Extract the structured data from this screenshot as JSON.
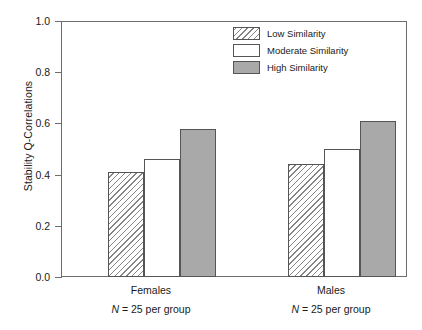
{
  "chart_data": {
    "type": "bar",
    "title": "",
    "subtitle": "",
    "xlabel": "",
    "ylabel": "Stability Q-Correlations",
    "ylim": [
      0.0,
      1.0
    ],
    "ytick_labels": [
      "0.0",
      "0.2",
      "0.4",
      "0.6",
      "0.8",
      "1.0"
    ],
    "ytick_values": [
      0.0,
      0.2,
      0.4,
      0.6,
      0.8,
      1.0
    ],
    "grid": false,
    "legend_position": "top-right",
    "categories": [
      "Females",
      "Males"
    ],
    "category_annotations": [
      "N = 25 per group",
      "N = 25 per group"
    ],
    "series": [
      {
        "name": "Low Similarity",
        "values": [
          0.41,
          0.44
        ],
        "fill": "diagonal-hatch",
        "color": "#ffffff"
      },
      {
        "name": "Moderate Similarity",
        "values": [
          0.46,
          0.5
        ],
        "fill": "solid",
        "color": "#ffffff"
      },
      {
        "name": "High Similarity",
        "values": [
          0.58,
          0.61
        ],
        "fill": "solid",
        "color": "#a9a9a9"
      }
    ]
  },
  "legend": {
    "items": [
      {
        "label": "Low Similarity",
        "swatch": "low"
      },
      {
        "label": "Moderate Similarity",
        "swatch": "moderate"
      },
      {
        "label": "High Similarity",
        "swatch": "high"
      }
    ]
  },
  "axis": {
    "y_label": "Stability Q-Correlations",
    "y_ticks": [
      "1.0",
      "0.8",
      "0.6",
      "0.4",
      "0.2",
      "0.0"
    ]
  },
  "groups": [
    {
      "label": "Females",
      "n_prefix": "N",
      "n_text": " = 25 per group"
    },
    {
      "label": "Males",
      "n_prefix": "N",
      "n_text": " = 25 per group"
    }
  ],
  "colors": {
    "axis": "#6d6d6d",
    "bar_outline": "#555555",
    "high_similarity_fill": "#a9a9a9",
    "hatch_stroke": "#858585",
    "text": "#1a1a1a"
  }
}
